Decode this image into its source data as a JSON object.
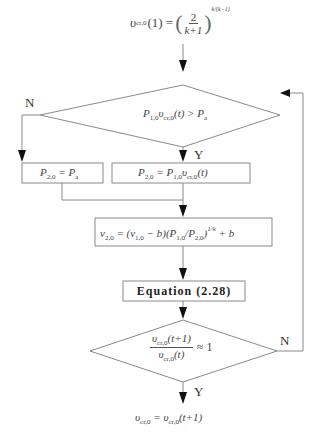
{
  "diagram": {
    "type": "flowchart",
    "start": {
      "lhs": "υ",
      "lhs_sub": "cr,0",
      "lhs_arg": "(1) =",
      "frac_num": "2",
      "frac_den": "k+1",
      "exponent": "k/(k−1)"
    },
    "decision_1": {
      "text_a": "P",
      "text_a_sub": "1,0",
      "text_b": "υ",
      "text_b_sub": "cr,0",
      "text_c": "(t) > P",
      "text_c_sub": "a",
      "no_label": "N",
      "yes_label": "Y"
    },
    "box_no": {
      "text_a": "P",
      "sub_a": "2,0",
      "text_b": " = P",
      "sub_b": "a"
    },
    "box_yes": {
      "text_a": "P",
      "sub_a": "2,0",
      "text_b": " = P",
      "sub_b": "1,0",
      "text_c": "υ",
      "sub_c": "cr,0",
      "text_d": "(t)"
    },
    "box_volume": {
      "text_a": "v",
      "sub_a": "2,0",
      "text_b": " = (v",
      "sub_b": "1,0",
      "text_c": " − b)(P",
      "sub_c": "1,0",
      "text_d": "/P",
      "sub_d": "2,0",
      "text_e": ")",
      "sup_e": "1/k",
      "text_f": " + b"
    },
    "box_equation": {
      "label": "Equation (2.28)"
    },
    "decision_2": {
      "num_a": "υ",
      "num_sub": "cr,0",
      "num_b": "(t+1)",
      "den_a": "υ",
      "den_sub": "cr,0",
      "den_b": "(t)",
      "rhs": "≈ 1",
      "no_label": "N",
      "yes_label": "Y"
    },
    "end": {
      "text_a": "υ",
      "sub_a": "cr,0",
      "text_b": " = υ",
      "sub_b": "cr,0",
      "text_c": "(t+1)"
    },
    "colors": {
      "line": "#888888",
      "arrow": "#111111",
      "text": "#444444"
    }
  }
}
